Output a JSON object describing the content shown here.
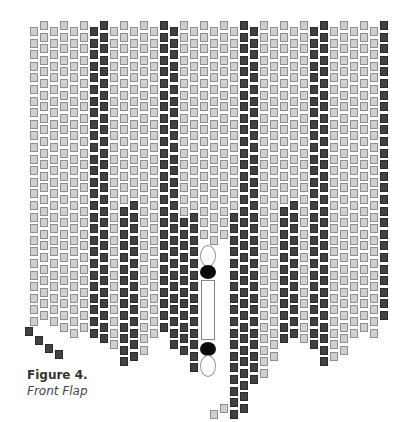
{
  "figure": {
    "title": "Figure 4.",
    "subtitle": "Front Flap"
  },
  "pattern": {
    "type": "peyote-stitch bead chart",
    "colors": {
      "light": "#cfcfcf",
      "dark": "#414141",
      "black": "#0a0a0a",
      "white": "#ffffff"
    },
    "columns": 36,
    "column_spacing_px": 10,
    "first_column_x": 30,
    "row_pitch_px": 11.6,
    "center_feature": [
      "white-oval",
      "black-oval",
      "bugle-bead",
      "black-oval",
      "white-oval"
    ]
  }
}
